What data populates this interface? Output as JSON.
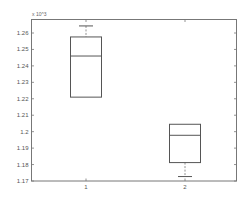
{
  "chart_data": {
    "type": "box",
    "title": "",
    "xlabel": "",
    "ylabel": "",
    "y_exponent_label": "x 10^3",
    "categories": [
      "1",
      "2"
    ],
    "ylim": [
      1.17,
      1.265
    ],
    "yticks": [
      1.17,
      1.18,
      1.19,
      1.2,
      1.21,
      1.22,
      1.23,
      1.24,
      1.25,
      1.26
    ],
    "ytick_labels": [
      "1.17",
      "1.18",
      "1.19",
      "1.2",
      "1.21",
      "1.22",
      "1.23",
      "1.24",
      "1.25",
      "1.26"
    ],
    "series": [
      {
        "name": "1",
        "whisker_low": 1.221,
        "q1": 1.221,
        "median": 1.246,
        "q3": 1.2576,
        "whisker_high": 1.2643
      },
      {
        "name": "2",
        "whisker_low": 1.1727,
        "q1": 1.1812,
        "median": 1.1978,
        "q3": 1.2045,
        "whisker_high": 1.2045
      }
    ],
    "grid": false,
    "legend": "none"
  }
}
